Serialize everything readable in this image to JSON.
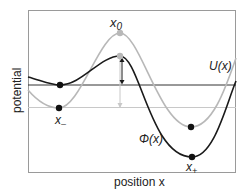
{
  "figure": {
    "xlabel": "position x",
    "ylabel": "potential",
    "curves": [
      {
        "name": "U(x)",
        "label": "U(x)",
        "color": "#b8b8b8"
      },
      {
        "name": "Phi(x)",
        "label": "Φ(x)",
        "color": "#1a1a1a"
      }
    ],
    "points": {
      "x_minus": "x",
      "x_minus_sub": "–",
      "x_zero": "x",
      "x_zero_sub": "0",
      "x_plus": "x",
      "x_plus_sub": "+"
    },
    "colors": {
      "frame": "#999999",
      "dark_curve": "#1a1a1a",
      "light_curve": "#b8b8b8",
      "dark_level": "#333333",
      "light_level": "#c8c8c8"
    }
  }
}
